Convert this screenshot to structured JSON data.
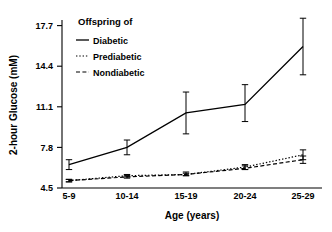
{
  "chart_data": {
    "type": "line",
    "title": "",
    "xlabel": "Age (years)",
    "ylabel": "2-hour Glucose (mM)",
    "categories": [
      "5-9",
      "10-14",
      "15-19",
      "20-24",
      "25-29"
    ],
    "ytick_labels": [
      "4.5",
      "7.8",
      "11.1",
      "14.4",
      "17.7"
    ],
    "ytick_values": [
      4.5,
      7.8,
      11.1,
      14.4,
      17.7
    ],
    "ylim": [
      4.5,
      18.6
    ],
    "grid": false,
    "legend_position": "top-left",
    "legend_title": "Offspring of",
    "series": [
      {
        "name": "Diabetic",
        "style": "solid",
        "values": [
          6.4,
          7.8,
          10.6,
          11.3,
          16.0
        ],
        "err_low": [
          6.0,
          7.2,
          8.9,
          9.9,
          13.7
        ],
        "err_high": [
          6.8,
          8.4,
          12.3,
          12.9,
          18.3
        ]
      },
      {
        "name": "Prediabetic",
        "style": "dotted",
        "values": [
          5.1,
          5.5,
          5.6,
          6.2,
          7.2
        ],
        "err_low": [
          5.0,
          5.4,
          5.5,
          6.0,
          6.8
        ],
        "err_high": [
          5.2,
          5.6,
          5.8,
          6.4,
          7.6
        ]
      },
      {
        "name": "Nondiabetic",
        "style": "dashed",
        "values": [
          5.1,
          5.4,
          5.6,
          6.1,
          6.8
        ],
        "err_low": [
          5.0,
          5.3,
          5.5,
          6.0,
          6.5
        ],
        "err_high": [
          5.2,
          5.5,
          5.7,
          6.3,
          7.1
        ]
      }
    ]
  },
  "axis": {
    "x_title": "Age (years)",
    "y_title": "2-hour Glucose (mM)"
  },
  "legend": {
    "title": "Offspring of",
    "items": [
      {
        "label": "Diabetic"
      },
      {
        "label": "Prediabetic"
      },
      {
        "label": "Nondiabetic"
      }
    ]
  }
}
